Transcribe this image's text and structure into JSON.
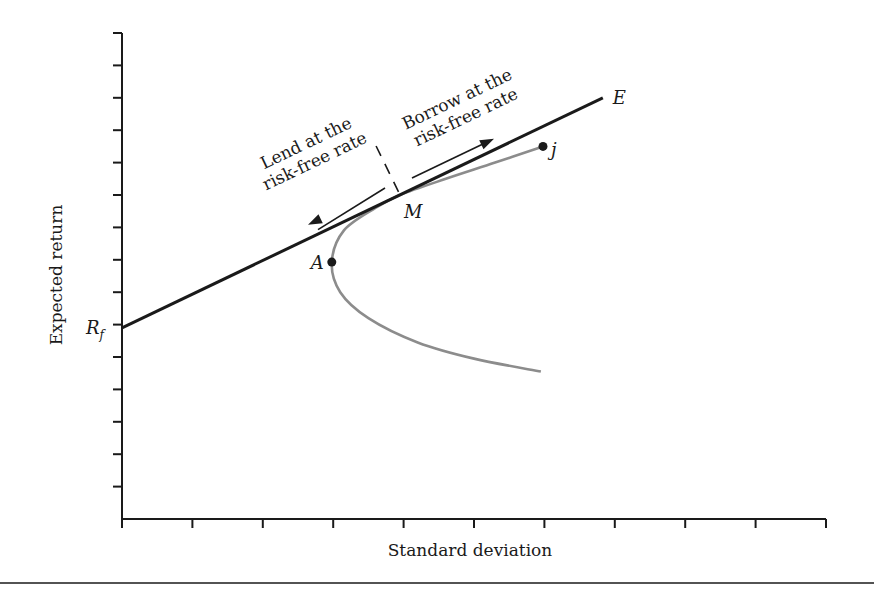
{
  "chart_data": {
    "type": "line",
    "title": "",
    "xlabel": "Standard deviation",
    "ylabel": "Expected return",
    "xlim": [
      0,
      10
    ],
    "ylim": [
      0,
      15
    ],
    "x_tick_count": 10,
    "y_tick_count": 15,
    "x_tick_labels": [],
    "y_tick_labels": [
      {
        "value": 5.9,
        "label": "R_f"
      }
    ],
    "grid": false,
    "legend": "none",
    "series": [
      {
        "name": "Capital market line",
        "color": "#1a1a1a",
        "points": [
          [
            0,
            5.9
          ],
          [
            6.83,
            13.0
          ]
        ]
      },
      {
        "name": "Efficient frontier (risky assets)",
        "color": "#8c8c8c",
        "points": [
          [
            5.95,
            4.55
          ],
          [
            5.0,
            4.95
          ],
          [
            4.2,
            5.45
          ],
          [
            3.5,
            6.2
          ],
          [
            3.1,
            7.0
          ],
          [
            2.98,
            7.93
          ],
          [
            3.15,
            8.9
          ],
          [
            3.6,
            9.6
          ],
          [
            3.95,
            10.0
          ],
          [
            4.6,
            10.5
          ],
          [
            5.3,
            11.0
          ],
          [
            5.98,
            11.5
          ]
        ]
      }
    ],
    "points": [
      {
        "name": "A",
        "x": 2.98,
        "y": 7.93,
        "marker": true
      },
      {
        "name": "j",
        "x": 5.98,
        "y": 11.5,
        "marker": true
      },
      {
        "name": "M",
        "x": 3.95,
        "y": 10.0,
        "marker": false
      },
      {
        "name": "E",
        "x": 6.83,
        "y": 13.0,
        "marker": false
      }
    ],
    "annotations": [
      {
        "text_lines": [
          "Lend at the",
          "risk-free rate"
        ],
        "arrow": "toward lower-left along CML"
      },
      {
        "text_lines": [
          "Borrow at the",
          "risk-free rate"
        ],
        "arrow": "toward upper-right along CML"
      }
    ],
    "divider": {
      "style": "dashed",
      "at_x": 3.95
    }
  }
}
